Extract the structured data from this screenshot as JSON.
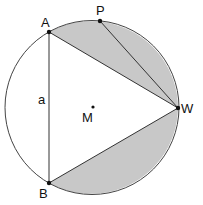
{
  "figure": {
    "circle": {
      "cx": 92,
      "cy": 107.5,
      "r": 87
    },
    "colors": {
      "fill": "#c8c8c8",
      "stroke": "#333333",
      "background": "#ffffff"
    },
    "points": {
      "A": {
        "label": "A",
        "x": 49,
        "y": 32
      },
      "P": {
        "label": "P",
        "x": 100,
        "y": 21
      },
      "W": {
        "label": "W",
        "x": 178,
        "y": 108
      },
      "B": {
        "label": "B",
        "x": 49,
        "y": 183
      },
      "M": {
        "label": "M",
        "x": 93,
        "y": 107
      }
    },
    "side_label": "a"
  }
}
